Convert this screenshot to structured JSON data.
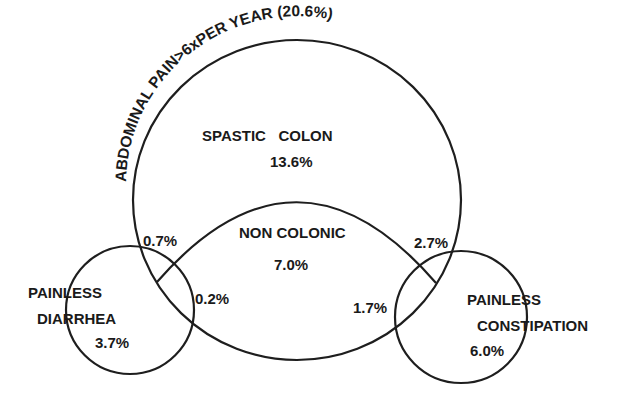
{
  "diagram": {
    "title": "ABDOMINAL  PAIN>6xPER  YEAR (20.6%)",
    "stroke_color": "#1e1e1e",
    "background": "#ffffff",
    "regions": {
      "spastic_colon": {
        "label": "SPASTIC   COLON",
        "value": "13.6%"
      },
      "non_colonic": {
        "label": "NON COLONIC",
        "value": "7.0%"
      },
      "painless_diarrhea": {
        "label_line1": "PAINLESS",
        "label_line2": "DIARRHEA",
        "value": "3.7%"
      },
      "painless_constipation": {
        "label_line1": "PAINLESS",
        "label_line2": "CONSTIPATION",
        "value": "6.0%"
      }
    },
    "overlaps": {
      "diarrhea_spastic": "0.7%",
      "diarrhea_noncolonic": "0.2%",
      "constipation_spastic": "2.7%",
      "constipation_noncolonic": "1.7%"
    }
  }
}
